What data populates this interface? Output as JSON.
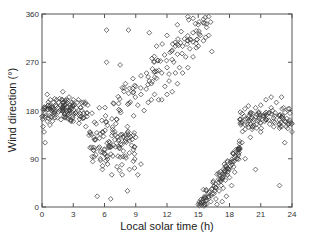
{
  "chart_data": {
    "type": "scatter",
    "title": "",
    "xlabel": "Local solar time (h)",
    "ylabel": "Wind direction (°)",
    "xlim": [
      0,
      24
    ],
    "ylim": [
      0,
      360
    ],
    "xticks": [
      0,
      3,
      6,
      9,
      12,
      15,
      18,
      21,
      24
    ],
    "yticks": [
      0,
      90,
      180,
      270,
      360
    ],
    "grid": false,
    "legend": null,
    "marker": "open-diamond",
    "marker_color": "#333333",
    "series": [
      {
        "name": "observations",
        "clusters": [
          {
            "desc": "night/morning band",
            "x_range": [
              0,
              4.5
            ],
            "y_center": 180,
            "y_spread": 30
          },
          {
            "desc": "morning dip",
            "x_range": [
              4.5,
              9
            ],
            "y_center": 120,
            "y_spread": 60
          },
          {
            "desc": "daytime veer",
            "x_range": [
              6,
              16
            ],
            "y_start": 170,
            "y_end": 350,
            "y_spread": 45
          },
          {
            "desc": "afternoon wrap low",
            "x_range": [
              15,
              19
            ],
            "y_start": 0,
            "y_end": 110,
            "y_spread": 25
          },
          {
            "desc": "evening band",
            "x_range": [
              19,
              24
            ],
            "y_center": 165,
            "y_spread": 30
          }
        ],
        "points": [
          [
            0.1,
            150
          ],
          [
            0.2,
            140
          ],
          [
            0.3,
            175
          ],
          [
            0.4,
            185
          ],
          [
            0.5,
            160
          ],
          [
            0.6,
            190
          ],
          [
            0.7,
            170
          ],
          [
            0.8,
            200
          ],
          [
            0.9,
            180
          ],
          [
            1.0,
            185
          ],
          [
            1.1,
            195
          ],
          [
            1.2,
            175
          ],
          [
            1.3,
            190
          ],
          [
            1.4,
            200
          ],
          [
            1.5,
            185
          ],
          [
            1.6,
            195
          ],
          [
            1.7,
            180
          ],
          [
            1.8,
            190
          ],
          [
            1.9,
            200
          ],
          [
            2.0,
            195
          ],
          [
            2.1,
            185
          ],
          [
            2.2,
            190
          ],
          [
            2.3,
            200
          ],
          [
            2.4,
            195
          ],
          [
            2.5,
            180
          ],
          [
            2.6,
            205
          ],
          [
            2.7,
            190
          ],
          [
            2.8,
            185
          ],
          [
            2.9,
            195
          ],
          [
            3.0,
            200
          ],
          [
            3.1,
            190
          ],
          [
            3.2,
            175
          ],
          [
            3.3,
            185
          ],
          [
            3.4,
            195
          ],
          [
            3.5,
            200
          ],
          [
            3.6,
            170
          ],
          [
            3.7,
            185
          ],
          [
            3.8,
            180
          ],
          [
            3.9,
            165
          ],
          [
            4.0,
            175
          ],
          [
            0.3,
            120
          ],
          [
            0.5,
            210
          ],
          [
            1.0,
            160
          ],
          [
            2.0,
            215
          ],
          [
            3.0,
            160
          ],
          [
            4.2,
            150
          ],
          [
            4.4,
            190
          ],
          [
            4.6,
            140
          ],
          [
            4.8,
            175
          ],
          [
            5.0,
            130
          ],
          [
            5.2,
            155
          ],
          [
            5.4,
            110
          ],
          [
            5.5,
            185
          ],
          [
            5.6,
            90
          ],
          [
            5.8,
            140
          ],
          [
            6.0,
            100
          ],
          [
            6.1,
            170
          ],
          [
            6.3,
            80
          ],
          [
            6.5,
            120
          ],
          [
            6.7,
            60
          ],
          [
            6.8,
            95
          ],
          [
            7.0,
            140
          ],
          [
            7.2,
            75
          ],
          [
            7.4,
            110
          ],
          [
            7.5,
            180
          ],
          [
            7.7,
            60
          ],
          [
            7.8,
            130
          ],
          [
            8.0,
            95
          ],
          [
            8.2,
            150
          ],
          [
            8.4,
            70
          ],
          [
            8.6,
            115
          ],
          [
            8.8,
            170
          ],
          [
            9.0,
            130
          ],
          [
            5.3,
            20
          ],
          [
            6.6,
            15
          ],
          [
            5.8,
            70
          ],
          [
            8.2,
            30
          ],
          [
            9.2,
            60
          ],
          [
            9.5,
            80
          ],
          [
            6.2,
            330
          ],
          [
            8.3,
            330
          ],
          [
            10.3,
            325
          ],
          [
            12.8,
            300
          ],
          [
            7.5,
            265
          ],
          [
            6.2,
            270
          ],
          [
            9.0,
            225
          ],
          [
            10.5,
            200
          ],
          [
            9.2,
            190
          ],
          [
            9.5,
            210
          ],
          [
            9.8,
            180
          ],
          [
            10.0,
            220
          ],
          [
            10.2,
            195
          ],
          [
            10.5,
            230
          ],
          [
            10.8,
            210
          ],
          [
            11.0,
            240
          ],
          [
            11.2,
            200
          ],
          [
            11.5,
            250
          ],
          [
            11.8,
            225
          ],
          [
            12.0,
            260
          ],
          [
            12.2,
            235
          ],
          [
            12.5,
            275
          ],
          [
            12.8,
            250
          ],
          [
            13.0,
            285
          ],
          [
            13.2,
            260
          ],
          [
            13.5,
            300
          ],
          [
            13.8,
            280
          ],
          [
            14.0,
            310
          ],
          [
            14.2,
            295
          ],
          [
            14.5,
            325
          ],
          [
            14.8,
            305
          ],
          [
            15.0,
            340
          ],
          [
            15.2,
            320
          ],
          [
            15.5,
            350
          ],
          [
            15.8,
            335
          ],
          [
            16.0,
            355
          ],
          [
            16.2,
            345
          ],
          [
            11.5,
            200
          ],
          [
            12.0,
            210
          ],
          [
            12.5,
            215
          ],
          [
            13.0,
            230
          ],
          [
            13.5,
            250
          ],
          [
            14.0,
            260
          ],
          [
            14.5,
            280
          ],
          [
            15.0,
            300
          ],
          [
            15.5,
            310
          ],
          [
            16.0,
            320
          ],
          [
            16.3,
            290
          ],
          [
            13.0,
            340
          ],
          [
            14.0,
            355
          ],
          [
            12.0,
            320
          ],
          [
            11.0,
            300
          ],
          [
            15.0,
            5
          ],
          [
            15.3,
            10
          ],
          [
            15.5,
            15
          ],
          [
            15.8,
            5
          ],
          [
            16.0,
            20
          ],
          [
            16.2,
            10
          ],
          [
            16.5,
            25
          ],
          [
            16.7,
            15
          ],
          [
            17.0,
            30
          ],
          [
            17.2,
            40
          ],
          [
            17.4,
            35
          ],
          [
            17.6,
            50
          ],
          [
            17.8,
            60
          ],
          [
            18.0,
            70
          ],
          [
            18.2,
            85
          ],
          [
            18.4,
            75
          ],
          [
            18.6,
            95
          ],
          [
            18.8,
            100
          ],
          [
            17.0,
            60
          ],
          [
            17.5,
            80
          ],
          [
            18.0,
            55
          ],
          [
            16.8,
            5
          ],
          [
            17.3,
            10
          ],
          [
            17.7,
            20
          ],
          [
            18.5,
            65
          ],
          [
            19.0,
            110
          ],
          [
            18.2,
            40
          ],
          [
            19.2,
            120
          ],
          [
            19.5,
            145
          ],
          [
            19.8,
            160
          ],
          [
            20.0,
            175
          ],
          [
            20.2,
            150
          ],
          [
            20.5,
            185
          ],
          [
            20.8,
            165
          ],
          [
            21.0,
            190
          ],
          [
            21.2,
            170
          ],
          [
            21.5,
            200
          ],
          [
            21.8,
            175
          ],
          [
            22.0,
            185
          ],
          [
            22.2,
            160
          ],
          [
            22.5,
            195
          ],
          [
            22.8,
            170
          ],
          [
            23.0,
            150
          ],
          [
            23.2,
            185
          ],
          [
            23.5,
            165
          ],
          [
            23.8,
            175
          ],
          [
            24.0,
            140
          ],
          [
            20.0,
            130
          ],
          [
            21.0,
            140
          ],
          [
            22.0,
            205
          ],
          [
            23.0,
            205
          ],
          [
            23.3,
            120
          ],
          [
            22.8,
            40
          ],
          [
            20.5,
            70
          ],
          [
            19.5,
            90
          ]
        ]
      }
    ]
  },
  "axes": {
    "x_title": "Local solar time (h)",
    "y_title": "Wind direction (°)",
    "x_tick_labels": [
      "0",
      "3",
      "6",
      "9",
      "12",
      "15",
      "18",
      "21",
      "24"
    ],
    "y_tick_labels": [
      "0",
      "90",
      "180",
      "270",
      "360"
    ]
  }
}
